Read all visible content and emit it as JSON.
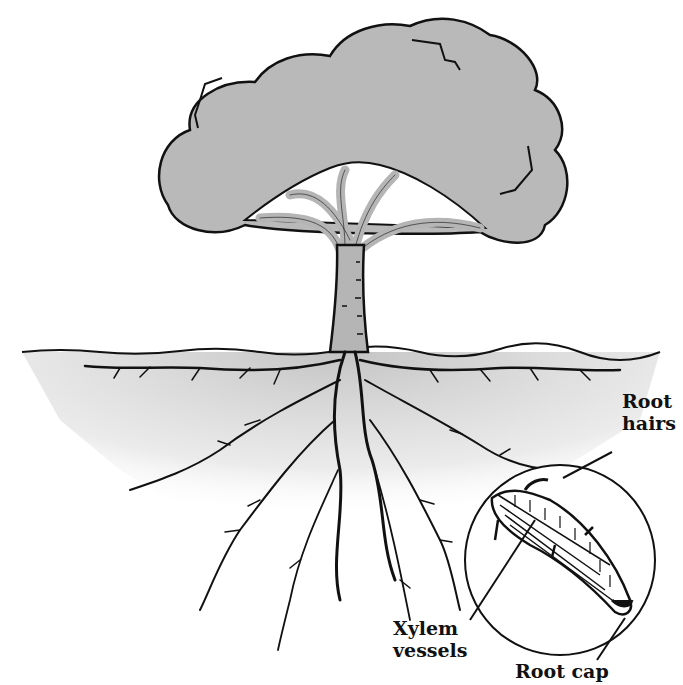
{
  "diagram": {
    "colors": {
      "canopy": "#b9b9b9",
      "trunk": "#b5b5b5",
      "soil": "#c8c8c8",
      "ink": "#111111",
      "background": "#ffffff"
    },
    "labels": {
      "root_hairs": {
        "line1": "Root",
        "line2": "hairs"
      },
      "xylem_vessels": {
        "line1": "Xylem",
        "line2": "vessels"
      },
      "root_cap": {
        "line1": "Root cap"
      }
    }
  }
}
